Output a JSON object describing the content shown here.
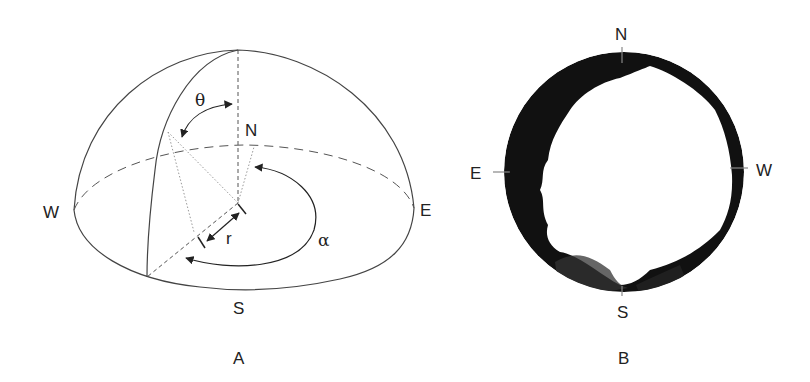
{
  "panel_a": {
    "caption": "A",
    "labels": {
      "north": "N",
      "south": "S",
      "east": "E",
      "west": "W"
    },
    "symbols": {
      "zenith_angle": "θ",
      "azimuth": "α",
      "radius": "r"
    }
  },
  "panel_b": {
    "caption": "B",
    "labels": {
      "north": "N",
      "south": "S",
      "east": "E",
      "west": "W"
    }
  },
  "colors": {
    "line": "#444444",
    "canopy": "#111111",
    "background": "#ffffff"
  }
}
